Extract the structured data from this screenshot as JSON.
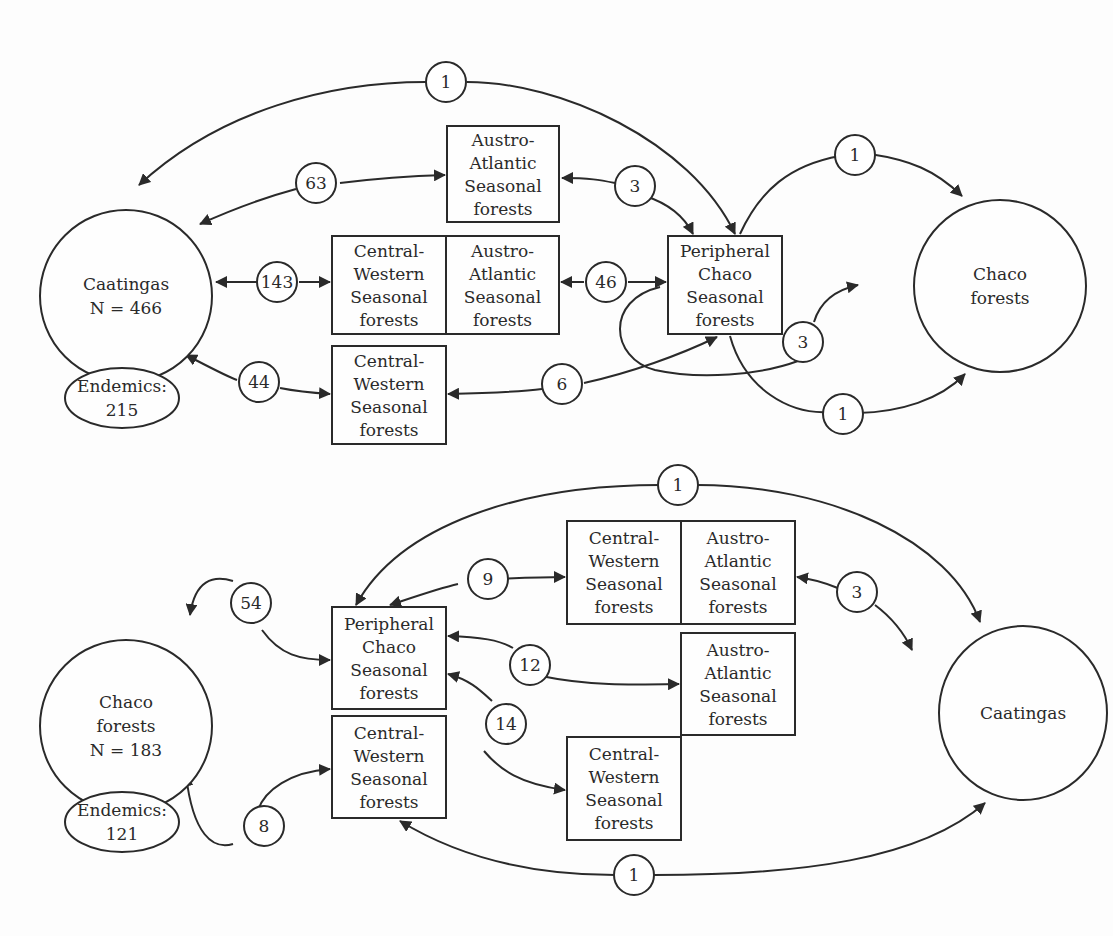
{
  "colors": {
    "stroke": "#2a2a2a",
    "background": "#fdfdfd",
    "node_fill": "#fefefe"
  },
  "panels": [
    {
      "id": "top",
      "circles": [
        {
          "id": "caatingas",
          "cx": 126,
          "cy": 296,
          "rx": 86,
          "ry": 86,
          "lines": [
            "Caatingas",
            "N = 466"
          ]
        },
        {
          "id": "chaco",
          "cx": 1000,
          "cy": 286,
          "rx": 86,
          "ry": 86,
          "lines": [
            "Chaco",
            "forests"
          ]
        },
        {
          "id": "endemics",
          "cx": 122,
          "cy": 398,
          "rx": 57,
          "ry": 30,
          "lines": [
            "Endemics:",
            "215"
          ]
        }
      ],
      "boxes": [
        {
          "id": "austro-atlantic-top",
          "x": 447,
          "y": 126,
          "w": 112,
          "h": 96,
          "lines": [
            "Austro-",
            "Atlantic",
            "Seasonal",
            "forests"
          ]
        },
        {
          "id": "central-western-mid",
          "x": 332,
          "y": 236,
          "w": 114,
          "h": 98,
          "lines": [
            "Central-",
            "Western",
            "Seasonal",
            "forests"
          ]
        },
        {
          "id": "austro-atlantic-mid",
          "x": 446,
          "y": 236,
          "w": 113,
          "h": 98,
          "lines": [
            "Austro-",
            "Atlantic",
            "Seasonal",
            "forests"
          ]
        },
        {
          "id": "central-western-low",
          "x": 332,
          "y": 346,
          "w": 114,
          "h": 98,
          "lines": [
            "Central-",
            "Western",
            "Seasonal",
            "forests"
          ]
        },
        {
          "id": "peripheral-chaco",
          "x": 668,
          "y": 236,
          "w": 114,
          "h": 98,
          "lines": [
            "Peripheral",
            "Chaco",
            "Seasonal",
            "forests"
          ]
        }
      ],
      "edges": [
        {
          "d": "M 139 185 C 220 110, 330 82, 426 82",
          "arrow_start": true,
          "arrow_end": false
        },
        {
          "d": "M 467 82 C 560 82, 690 140, 735 234",
          "arrow_start": false,
          "arrow_end": true
        },
        {
          "d": "M 200 224 C 240 206, 270 196, 296 189",
          "arrow_start": true,
          "arrow_end": false
        },
        {
          "d": "M 340 183 C 380 178, 410 176, 445 175",
          "arrow_start": false,
          "arrow_end": true
        },
        {
          "d": "M 562 178 C 590 178, 600 180, 615 183",
          "arrow_start": true,
          "arrow_end": false
        },
        {
          "d": "M 645 196 C 670 204, 685 218, 693 234",
          "arrow_start": false,
          "arrow_end": true
        },
        {
          "d": "M 216 282 L 257 282",
          "arrow_start": true,
          "arrow_end": false
        },
        {
          "d": "M 299 282 L 330 282",
          "arrow_start": false,
          "arrow_end": true
        },
        {
          "d": "M 561 282 L 584 282",
          "arrow_start": true,
          "arrow_end": false
        },
        {
          "d": "M 628 282 L 666 282",
          "arrow_start": false,
          "arrow_end": true
        },
        {
          "d": "M 186 355 C 215 370, 226 376, 237 380",
          "arrow_start": true,
          "arrow_end": false
        },
        {
          "d": "M 280 388 C 300 392, 315 393, 330 394",
          "arrow_start": false,
          "arrow_end": true
        },
        {
          "d": "M 448 394 C 490 393, 520 392, 542 389",
          "arrow_start": true,
          "arrow_end": false
        },
        {
          "d": "M 584 383 C 630 373, 680 355, 717 337",
          "arrow_start": false,
          "arrow_end": true
        },
        {
          "d": "M 840 156 C 790 165, 760 190, 740 234",
          "arrow_start": false,
          "arrow_end": false
        },
        {
          "d": "M 870 154 C 910 160, 935 170, 962 196",
          "arrow_start": false,
          "arrow_end": true
        },
        {
          "d": "M 798 361 C 760 375, 700 380, 655 370 C 610 358, 605 300, 660 287",
          "arrow_start": false,
          "arrow_end": false
        },
        {
          "d": "M 814 322 C 820 302, 835 290, 858 285",
          "arrow_start": false,
          "arrow_end": true
        },
        {
          "d": "M 730 336 C 745 390, 790 414, 828 412",
          "arrow_start": false,
          "arrow_end": false
        },
        {
          "d": "M 858 413 C 900 412, 940 400, 965 374",
          "arrow_start": false,
          "arrow_end": true
        }
      ],
      "counts": [
        {
          "id": "c1-top",
          "cx": 446,
          "cy": 82,
          "value": "1"
        },
        {
          "id": "c63",
          "cx": 316,
          "cy": 183,
          "value": "63"
        },
        {
          "id": "c3-austro",
          "cx": 635,
          "cy": 186,
          "value": "3"
        },
        {
          "id": "c143",
          "cx": 277,
          "cy": 282,
          "value": "143"
        },
        {
          "id": "c46",
          "cx": 606,
          "cy": 282,
          "value": "46"
        },
        {
          "id": "c44",
          "cx": 259,
          "cy": 382,
          "value": "44"
        },
        {
          "id": "c6",
          "cx": 562,
          "cy": 384,
          "value": "6"
        },
        {
          "id": "c1-chaco-top",
          "cx": 855,
          "cy": 155,
          "value": "1"
        },
        {
          "id": "c3-chaco",
          "cx": 803,
          "cy": 342,
          "value": "3"
        },
        {
          "id": "c1-chaco-bottom",
          "cx": 843,
          "cy": 414,
          "value": "1"
        }
      ]
    },
    {
      "id": "bottom",
      "circles": [
        {
          "id": "chaco",
          "cx": 126,
          "cy": 726,
          "rx": 86,
          "ry": 86,
          "lines": [
            "Chaco",
            "forests",
            "N = 183"
          ]
        },
        {
          "id": "caatingas",
          "cx": 1023,
          "cy": 713,
          "rx": 84,
          "ry": 87,
          "lines": [
            "Caatingas"
          ]
        },
        {
          "id": "endemics",
          "cx": 122,
          "cy": 822,
          "rx": 57,
          "ry": 30,
          "lines": [
            "Endemics:",
            "121"
          ]
        }
      ],
      "boxes": [
        {
          "id": "peripheral-chaco",
          "x": 332,
          "y": 607,
          "w": 114,
          "h": 102,
          "lines": [
            "Peripheral",
            "Chaco",
            "Seasonal",
            "forests"
          ]
        },
        {
          "id": "central-western-left",
          "x": 332,
          "y": 716,
          "w": 114,
          "h": 102,
          "lines": [
            "Central-",
            "Western",
            "Seasonal",
            "forests"
          ]
        },
        {
          "id": "central-western-top",
          "x": 567,
          "y": 521,
          "w": 114,
          "h": 103,
          "lines": [
            "Central-",
            "Western",
            "Seasonal",
            "forests"
          ]
        },
        {
          "id": "austro-atlantic-top",
          "x": 681,
          "y": 521,
          "w": 114,
          "h": 103,
          "lines": [
            "Austro-",
            "Atlantic",
            "Seasonal",
            "forests"
          ]
        },
        {
          "id": "austro-atlantic-mid",
          "x": 681,
          "y": 633,
          "w": 114,
          "h": 102,
          "lines": [
            "Austro-",
            "Atlantic",
            "Seasonal",
            "forests"
          ]
        },
        {
          "id": "central-western-low",
          "x": 567,
          "y": 737,
          "w": 114,
          "h": 103,
          "lines": [
            "Central-",
            "Western",
            "Seasonal",
            "forests"
          ]
        }
      ],
      "edges": [
        {
          "d": "M 356 605 C 400 525, 520 485, 660 485",
          "arrow_start": true,
          "arrow_end": false
        },
        {
          "d": "M 697 485 C 830 485, 950 540, 980 622",
          "arrow_start": false,
          "arrow_end": true
        },
        {
          "d": "M 390 605 C 420 595, 440 588, 458 584",
          "arrow_start": true,
          "arrow_end": false
        },
        {
          "d": "M 497 579 C 520 578, 540 577, 565 577",
          "arrow_start": false,
          "arrow_end": true
        },
        {
          "d": "M 797 577 C 820 580, 830 585, 840 589",
          "arrow_start": true,
          "arrow_end": false
        },
        {
          "d": "M 875 605 C 895 620, 905 635, 912 650",
          "arrow_start": false,
          "arrow_end": true
        },
        {
          "d": "M 233 581 C 213 575, 195 580, 190 615",
          "arrow_start": false,
          "arrow_end": true
        },
        {
          "d": "M 262 630 C 280 655, 300 660, 330 660",
          "arrow_start": false,
          "arrow_end": true
        },
        {
          "d": "M 448 636 C 480 637, 500 640, 513 648",
          "arrow_start": true,
          "arrow_end": false
        },
        {
          "d": "M 541 676 C 590 686, 630 685, 679 684",
          "arrow_start": false,
          "arrow_end": true
        },
        {
          "d": "M 448 674 C 470 680, 480 690, 492 701",
          "arrow_start": true,
          "arrow_end": false
        },
        {
          "d": "M 484 751 C 500 770, 520 784, 565 790",
          "arrow_start": false,
          "arrow_end": true
        },
        {
          "d": "M 233 844 C 213 850, 193 835, 186 775",
          "arrow_start": false,
          "arrow_end": true
        },
        {
          "d": "M 258 810 C 265 790, 290 772, 330 769",
          "arrow_start": false,
          "arrow_end": true
        },
        {
          "d": "M 400 821 C 480 870, 570 875, 615 875",
          "arrow_start": true,
          "arrow_end": false
        },
        {
          "d": "M 654 875 C 800 875, 920 860, 985 803",
          "arrow_start": false,
          "arrow_end": true
        }
      ],
      "counts": [
        {
          "id": "c1-top",
          "cx": 678,
          "cy": 485,
          "value": "1"
        },
        {
          "id": "c54",
          "cx": 251,
          "cy": 603,
          "value": "54"
        },
        {
          "id": "c9",
          "cx": 488,
          "cy": 579,
          "value": "9"
        },
        {
          "id": "c3",
          "cx": 857,
          "cy": 592,
          "value": "3"
        },
        {
          "id": "c12",
          "cx": 530,
          "cy": 665,
          "value": "12"
        },
        {
          "id": "c14",
          "cx": 506,
          "cy": 724,
          "value": "14"
        },
        {
          "id": "c8",
          "cx": 264,
          "cy": 826,
          "value": "8"
        },
        {
          "id": "c1-bottom",
          "cx": 634,
          "cy": 875,
          "value": "1"
        }
      ]
    }
  ]
}
